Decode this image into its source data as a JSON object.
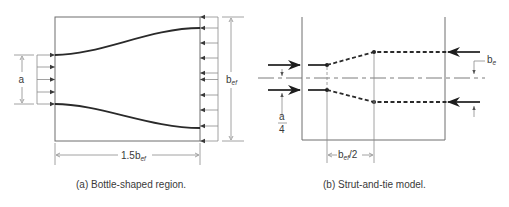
{
  "figure_a": {
    "caption": "(a) Bottle-shaped region.",
    "dim_width_label": "1.5b",
    "dim_width_sub": "ef",
    "dim_height_label": "b",
    "dim_height_sub": "ef",
    "load_width_label": "a"
  },
  "figure_b": {
    "caption": "(b) Strut-and-tie model.",
    "dim_spacing_label": "b",
    "dim_spacing_sub": "ef",
    "dim_spacing_suffix": "/2",
    "offset_label": "b",
    "offset_sub": "e",
    "fraction_num": "a",
    "fraction_den": "4"
  }
}
